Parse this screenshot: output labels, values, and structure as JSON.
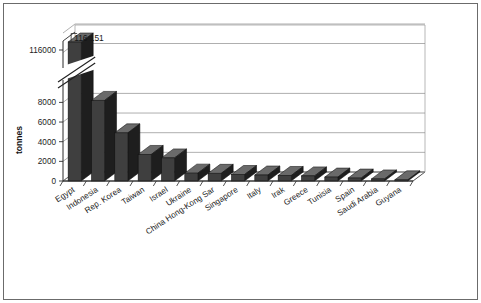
{
  "chart_data": {
    "type": "bar",
    "title": "",
    "subtitle": "",
    "xlabel": "",
    "ylabel": "tonnes",
    "categories": [
      "Egypt",
      "Indonesia",
      "Rep. Korea",
      "Taiwan",
      "Israel",
      "Ukraine",
      "China Hong-Kong Sar",
      "Singapore",
      "Italy",
      "Irak",
      "Greece",
      "Tunisia",
      "Spain",
      "Saudi Arabia",
      "Guyana"
    ],
    "values": [
      116151,
      8200,
      4900,
      2700,
      2350,
      800,
      780,
      660,
      610,
      560,
      520,
      400,
      300,
      210,
      120
    ],
    "data_labels": [
      "116 151",
      "",
      "",
      "",
      "",
      "",
      "",
      "",
      "",
      "",
      "",
      "",
      "",
      "",
      ""
    ],
    "ytick_labels": [
      "0",
      "2000",
      "4000",
      "6000",
      "8000",
      "116000"
    ],
    "ytick_values": [
      0,
      2000,
      4000,
      6000,
      8000,
      116000
    ],
    "ylim": [
      0,
      8600
    ],
    "axis_break": true,
    "axis_break_note": "y-axis broken between 8000 and 116000",
    "grid": true,
    "grid_axis": "y",
    "legend": false,
    "legend_position": "none",
    "style": "3d-column",
    "colors": {
      "bar_front": "#3f3f3f",
      "bar_side": "#1e1e1e",
      "bar_top": "#6a6a6a",
      "grid_line": "#8c8c8c",
      "axis_line": "#2b2b2b",
      "plot_background": "#ffffff",
      "border": "#6b6b6b",
      "text": "#1c1c1c"
    }
  }
}
